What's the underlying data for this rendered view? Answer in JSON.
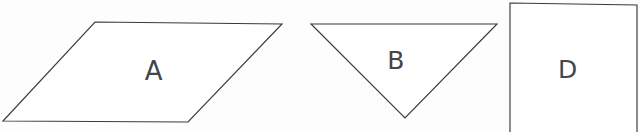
{
  "figure": {
    "background_color": "#fdfdfd",
    "stroke_color": "#3a3a40",
    "fill_color": "#ffffff",
    "width": 641,
    "height": 132
  },
  "shapes": [
    {
      "id": "shape-a",
      "label": "A",
      "kind": "parallelogram",
      "points": "95,22 282,24 188,122 3,121",
      "label_position": {
        "x": 154,
        "y": 71
      }
    },
    {
      "id": "shape-b",
      "label": "B",
      "kind": "triangle",
      "points": "311,24 497,24 405,118",
      "label_position": {
        "x": 396,
        "y": 60
      }
    },
    {
      "id": "shape-d",
      "label": "D",
      "kind": "rectangle",
      "points": "510,3 637,5 637,136 510,134",
      "label_position": {
        "x": 568,
        "y": 69
      },
      "cropped": "true"
    }
  ]
}
